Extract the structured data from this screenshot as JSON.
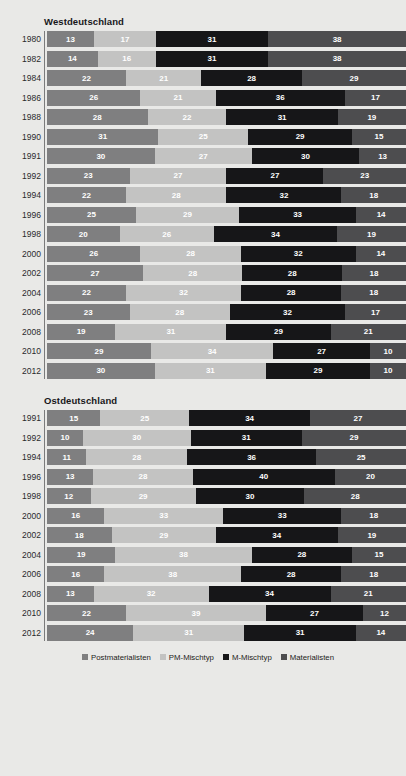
{
  "chart_data": {
    "type": "bar",
    "orientation": "horizontal",
    "stacked": true,
    "normalized_percent": true,
    "xlim": [
      0,
      100
    ],
    "grid": false,
    "legend_position": "bottom",
    "title": "",
    "xlabel": "",
    "ylabel": "",
    "series_names": [
      "Postmaterialisten",
      "PM-Mischtyp",
      "M-Mischtyp",
      "Materialisten"
    ],
    "series_colors": [
      "#7f7f80",
      "#c3c3c2",
      "#161618",
      "#4d4d4f"
    ],
    "panels": [
      {
        "title": "Westdeutschland",
        "categories": [
          "1980",
          "1982",
          "1984",
          "1986",
          "1988",
          "1990",
          "1991",
          "1992",
          "1994",
          "1996",
          "1998",
          "2000",
          "2002",
          "2004",
          "2006",
          "2008",
          "2010",
          "2012"
        ],
        "rows": [
          {
            "category": "1980",
            "values": [
              13,
              17,
              31,
              38
            ]
          },
          {
            "category": "1982",
            "values": [
              14,
              16,
              31,
              38
            ]
          },
          {
            "category": "1984",
            "values": [
              22,
              21,
              28,
              29
            ]
          },
          {
            "category": "1986",
            "values": [
              26,
              21,
              36,
              17
            ]
          },
          {
            "category": "1988",
            "values": [
              28,
              22,
              31,
              19
            ]
          },
          {
            "category": "1990",
            "values": [
              31,
              25,
              29,
              15
            ]
          },
          {
            "category": "1991",
            "values": [
              30,
              27,
              30,
              13
            ]
          },
          {
            "category": "1992",
            "values": [
              23,
              27,
              27,
              23
            ]
          },
          {
            "category": "1994",
            "values": [
              22,
              28,
              32,
              18
            ]
          },
          {
            "category": "1996",
            "values": [
              25,
              29,
              33,
              14
            ]
          },
          {
            "category": "1998",
            "values": [
              20,
              26,
              34,
              19
            ]
          },
          {
            "category": "2000",
            "values": [
              26,
              28,
              32,
              14
            ]
          },
          {
            "category": "2002",
            "values": [
              27,
              28,
              28,
              18
            ]
          },
          {
            "category": "2004",
            "values": [
              22,
              32,
              28,
              18
            ]
          },
          {
            "category": "2006",
            "values": [
              23,
              28,
              32,
              17
            ]
          },
          {
            "category": "2008",
            "values": [
              19,
              31,
              29,
              21
            ]
          },
          {
            "category": "2010",
            "values": [
              29,
              34,
              27,
              10
            ]
          },
          {
            "category": "2012",
            "values": [
              30,
              31,
              29,
              10
            ]
          }
        ]
      },
      {
        "title": "Ostdeutschland",
        "categories": [
          "1991",
          "1992",
          "1994",
          "1996",
          "1998",
          "2000",
          "2002",
          "2004",
          "2006",
          "2008",
          "2010",
          "2012"
        ],
        "rows": [
          {
            "category": "1991",
            "values": [
              15,
              25,
              34,
              27
            ]
          },
          {
            "category": "1992",
            "values": [
              10,
              30,
              31,
              29
            ]
          },
          {
            "category": "1994",
            "values": [
              11,
              28,
              36,
              25
            ]
          },
          {
            "category": "1996",
            "values": [
              13,
              28,
              40,
              20
            ]
          },
          {
            "category": "1998",
            "values": [
              12,
              29,
              30,
              28
            ]
          },
          {
            "category": "2000",
            "values": [
              16,
              33,
              33,
              18
            ]
          },
          {
            "category": "2002",
            "values": [
              18,
              29,
              34,
              19
            ]
          },
          {
            "category": "2004",
            "values": [
              19,
              38,
              28,
              15
            ]
          },
          {
            "category": "2006",
            "values": [
              16,
              38,
              28,
              18
            ]
          },
          {
            "category": "2008",
            "values": [
              13,
              32,
              34,
              21
            ]
          },
          {
            "category": "2010",
            "values": [
              22,
              39,
              27,
              12
            ]
          },
          {
            "category": "2012",
            "values": [
              24,
              31,
              31,
              14
            ]
          }
        ]
      }
    ],
    "legend": [
      {
        "label": "Postmaterialisten",
        "color": "#7f7f80"
      },
      {
        "label": "PM-Mischtyp",
        "color": "#c3c3c2"
      },
      {
        "label": "M-Mischtyp",
        "color": "#161618"
      },
      {
        "label": "Materialisten",
        "color": "#4d4d4f"
      }
    ]
  }
}
